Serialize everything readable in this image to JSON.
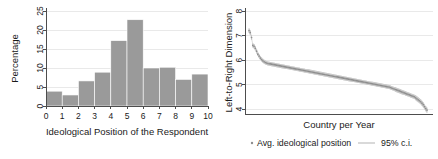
{
  "figure": {
    "panels": [
      "histogram",
      "ranked-dotplot"
    ],
    "background_color": "#ffffff",
    "bar_color": "#9a9a9a",
    "ci_color": "#cfcfcf",
    "dot_color": "#8e8e8e",
    "axis_color": "#4d4d4d",
    "grid_color": "#e9e9e9"
  },
  "chart_data": [
    {
      "type": "bar",
      "panel": "left",
      "title": "",
      "xlabel": "Ideological Position of the Respondent",
      "ylabel": "Percentage",
      "categories": [
        "0",
        "1",
        "2",
        "3",
        "4",
        "5",
        "6",
        "7",
        "8",
        "9",
        "10"
      ],
      "values": [
        3.9,
        2.9,
        6.6,
        8.9,
        17.2,
        22.7,
        10.0,
        10.2,
        7.0,
        8.4
      ],
      "xticks": [
        0,
        1,
        2,
        3,
        4,
        5,
        6,
        7,
        8,
        9,
        10
      ],
      "yticks": [
        0,
        5,
        10,
        15,
        20,
        25
      ],
      "xlim": [
        0,
        10
      ],
      "ylim": [
        0,
        25
      ],
      "grid": "horizontal"
    },
    {
      "type": "scatter",
      "panel": "right",
      "title": "",
      "xlabel": "Country per Year",
      "ylabel": "Left-to-Right Dimension",
      "yticks": [
        4,
        5,
        6,
        7,
        8
      ],
      "ylim": [
        3.8,
        8.0
      ],
      "xlim": [
        0,
        1
      ],
      "xtick_labels": [],
      "grid": "horizontal",
      "series": [
        {
          "name": "Avg. ideological position",
          "marker": "dot",
          "x_note": "rank index of country-year observations, sorted descending",
          "values": [
            7.2,
            7.12,
            6.92,
            6.6,
            6.56,
            6.48,
            6.36,
            6.24,
            6.16,
            6.08,
            6.02,
            5.97,
            5.93,
            5.9,
            5.88,
            5.86,
            5.85,
            5.84,
            5.83,
            5.82,
            5.81,
            5.8,
            5.79,
            5.78,
            5.77,
            5.76,
            5.75,
            5.74,
            5.73,
            5.72,
            5.71,
            5.7,
            5.69,
            5.68,
            5.67,
            5.66,
            5.65,
            5.64,
            5.63,
            5.62,
            5.61,
            5.6,
            5.59,
            5.58,
            5.57,
            5.56,
            5.55,
            5.54,
            5.53,
            5.52,
            5.51,
            5.5,
            5.49,
            5.48,
            5.47,
            5.46,
            5.45,
            5.44,
            5.43,
            5.42,
            5.41,
            5.4,
            5.39,
            5.38,
            5.37,
            5.36,
            5.35,
            5.34,
            5.33,
            5.32,
            5.31,
            5.3,
            5.29,
            5.28,
            5.27,
            5.26,
            5.25,
            5.24,
            5.23,
            5.22,
            5.21,
            5.2,
            5.19,
            5.18,
            5.17,
            5.16,
            5.15,
            5.14,
            5.13,
            5.12,
            5.11,
            5.1,
            5.09,
            5.08,
            5.07,
            5.06,
            5.05,
            5.04,
            5.03,
            5.02,
            5.01,
            5.0,
            4.99,
            4.98,
            4.97,
            4.96,
            4.95,
            4.94,
            4.93,
            4.92,
            4.91,
            4.9,
            4.88,
            4.86,
            4.84,
            4.82,
            4.8,
            4.78,
            4.76,
            4.74,
            4.72,
            4.7,
            4.68,
            4.66,
            4.64,
            4.62,
            4.6,
            4.58,
            4.56,
            4.54,
            4.52,
            4.5,
            4.46,
            4.42,
            4.38,
            4.34,
            4.3,
            4.24,
            4.18,
            4.1,
            4.02,
            3.96
          ]
        },
        {
          "name": "95% c.i.",
          "marker": "line",
          "half_width_note": "approximate half-width of the confidence interval at each observation",
          "half_widths": [
            0.1,
            0.1,
            0.1,
            0.09,
            0.09,
            0.09,
            0.09,
            0.08,
            0.08,
            0.08,
            0.08,
            0.08,
            0.08,
            0.08,
            0.08,
            0.08,
            0.08,
            0.08,
            0.08,
            0.08,
            0.08,
            0.08,
            0.08,
            0.08,
            0.08,
            0.08,
            0.08,
            0.08,
            0.08,
            0.08,
            0.08,
            0.08,
            0.08,
            0.08,
            0.08,
            0.08,
            0.08,
            0.08,
            0.08,
            0.08,
            0.08,
            0.08,
            0.08,
            0.08,
            0.08,
            0.08,
            0.08,
            0.08,
            0.08,
            0.08,
            0.08,
            0.08,
            0.08,
            0.08,
            0.08,
            0.08,
            0.08,
            0.08,
            0.08,
            0.08,
            0.08,
            0.08,
            0.08,
            0.08,
            0.08,
            0.08,
            0.08,
            0.08,
            0.08,
            0.08,
            0.08,
            0.08,
            0.08,
            0.08,
            0.08,
            0.08,
            0.08,
            0.08,
            0.08,
            0.08,
            0.08,
            0.08,
            0.08,
            0.08,
            0.08,
            0.08,
            0.08,
            0.08,
            0.08,
            0.08,
            0.08,
            0.08,
            0.08,
            0.08,
            0.08,
            0.08,
            0.08,
            0.08,
            0.08,
            0.08,
            0.08,
            0.08,
            0.08,
            0.08,
            0.08,
            0.08,
            0.08,
            0.08,
            0.08,
            0.08,
            0.08,
            0.08,
            0.08,
            0.08,
            0.08,
            0.08,
            0.09,
            0.09,
            0.09,
            0.09,
            0.09,
            0.09,
            0.09,
            0.09,
            0.09,
            0.09,
            0.09,
            0.09,
            0.09,
            0.09,
            0.09,
            0.09,
            0.1,
            0.1,
            0.1,
            0.1,
            0.1,
            0.1,
            0.1,
            0.11,
            0.11,
            0.11
          ]
        }
      ],
      "legend": {
        "position": "below",
        "entries": [
          {
            "label": "Avg. ideological position",
            "marker": "dot"
          },
          {
            "label": "95% c.i.",
            "marker": "line"
          }
        ]
      }
    }
  ]
}
